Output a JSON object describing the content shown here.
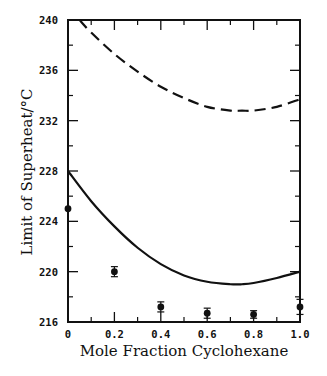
{
  "chart_data": {
    "type": "line",
    "title": "",
    "xlabel": "Mole Fraction Cyclohexane",
    "ylabel": "Limit of Superheat/°C",
    "xlim": [
      0,
      1.0
    ],
    "ylim": [
      216,
      240
    ],
    "x_ticks": [
      0,
      0.2,
      0.4,
      0.6,
      0.8,
      1.0
    ],
    "x_tick_labels": [
      "0",
      "0.2",
      "0.4",
      "0.6",
      "0.8",
      "1.0"
    ],
    "y_ticks": [
      216,
      220,
      224,
      228,
      232,
      236,
      240
    ],
    "y_tick_labels": [
      "216",
      "220",
      "224",
      "228",
      "232",
      "236",
      "240"
    ],
    "grid": false,
    "legend": null,
    "series": [
      {
        "name": "Upper prediction (dashed)",
        "style": "dashed",
        "x": [
          0.05,
          0.1,
          0.2,
          0.3,
          0.4,
          0.5,
          0.6,
          0.7,
          0.75,
          0.8,
          0.9,
          1.0
        ],
        "y": [
          240.0,
          239.0,
          237.3,
          235.9,
          234.7,
          233.8,
          233.1,
          232.8,
          232.8,
          232.8,
          233.1,
          233.7
        ]
      },
      {
        "name": "Lower prediction (solid)",
        "style": "solid",
        "x": [
          0,
          0.1,
          0.2,
          0.3,
          0.4,
          0.5,
          0.6,
          0.7,
          0.75,
          0.8,
          0.9,
          1.0
        ],
        "y": [
          228.0,
          225.6,
          223.6,
          221.9,
          220.6,
          219.7,
          219.2,
          219.0,
          219.0,
          219.1,
          219.5,
          220.0
        ]
      },
      {
        "name": "Experimental data",
        "style": "markers",
        "x": [
          0,
          0.2,
          0.4,
          0.6,
          0.8,
          1.0
        ],
        "y": [
          225.0,
          220.0,
          217.2,
          216.7,
          216.6,
          217.2
        ],
        "error": [
          0,
          0.4,
          0.4,
          0.4,
          0.3,
          0.6
        ]
      }
    ]
  }
}
